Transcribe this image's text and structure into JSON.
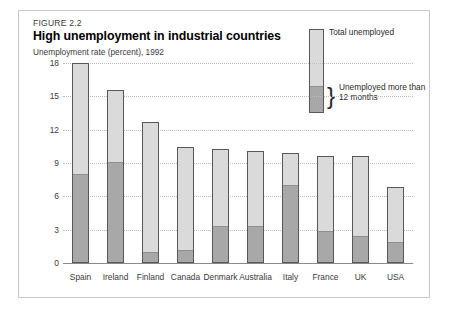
{
  "figure": {
    "number": "FIGURE 2.2",
    "title": "High unemployment in industrial countries",
    "subtitle": "Unemployment rate (percent), 1992"
  },
  "legend": {
    "total_label": "Total unemployed",
    "longterm_label_line1": "Unemployed more than",
    "longterm_label_line2": "12 months",
    "brace_glyph": "}"
  },
  "colors": {
    "total_fill": "#dadada",
    "longterm_fill": "#a8a8a8",
    "bar_border": "#585858",
    "gridline": "#bdbdbd",
    "frame": "#c9c9c9"
  },
  "chart_data": {
    "type": "bar",
    "subtype": "stacked-vertical",
    "title": "High unemployment in industrial countries",
    "subtitle": "Unemployment rate (percent), 1992",
    "xlabel": "",
    "ylabel": "Unemployment rate (percent), 1992",
    "ylim": [
      0,
      18
    ],
    "yticks": [
      0,
      3,
      6,
      9,
      12,
      15,
      18
    ],
    "grid": true,
    "legend_position": "top-right",
    "categories": [
      "Spain",
      "Ireland",
      "Finland",
      "Canada",
      "Denmark",
      "Australia",
      "Italy",
      "France",
      "UK",
      "USA"
    ],
    "series": [
      {
        "name": "Total unemployed",
        "values": [
          18.0,
          15.6,
          12.7,
          10.4,
          10.3,
          10.1,
          9.9,
          9.6,
          9.6,
          6.8
        ]
      },
      {
        "name": "Unemployed more than 12 months",
        "values": [
          7.9,
          9.0,
          0.9,
          1.1,
          3.2,
          3.2,
          6.9,
          2.8,
          2.3,
          1.8
        ]
      }
    ]
  }
}
